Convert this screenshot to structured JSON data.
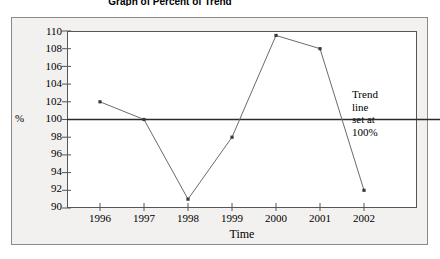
{
  "title": "Graph of Percent of Trend",
  "annotation": {
    "lines": [
      "Trend",
      "line",
      "set at",
      "100%"
    ]
  },
  "axis": {
    "y_unit_label": "%",
    "x_title": "Time"
  },
  "chart_data": {
    "type": "line",
    "title": "Graph of Percent of Trend",
    "xlabel": "Time",
    "ylabel": "%",
    "categories": [
      "1996",
      "1997",
      "1998",
      "1999",
      "2000",
      "2001",
      "2002"
    ],
    "values": [
      102,
      100,
      91,
      98,
      109.5,
      108,
      92
    ],
    "series": [
      {
        "name": "Percent of Trend",
        "values": [
          102,
          100,
          91,
          98,
          109.5,
          108,
          92
        ]
      }
    ],
    "ylim": [
      90,
      110
    ],
    "ytick_labels": [
      "110",
      "108",
      "106",
      "104",
      "102",
      "100",
      "98",
      "96",
      "94",
      "92",
      "90"
    ],
    "ytick_values": [
      110,
      108,
      106,
      104,
      102,
      100,
      98,
      96,
      94,
      92,
      90
    ],
    "xtick_labels": [
      "1996",
      "1997",
      "1998",
      "1999",
      "2000",
      "2001",
      "2002"
    ],
    "grid": false,
    "legend": false,
    "reference_line": {
      "value": 100,
      "label": "Trend line set at 100%"
    },
    "marker": "square",
    "line_color": "#6b6b6b",
    "reference_line_color": "#2a2a2a"
  }
}
